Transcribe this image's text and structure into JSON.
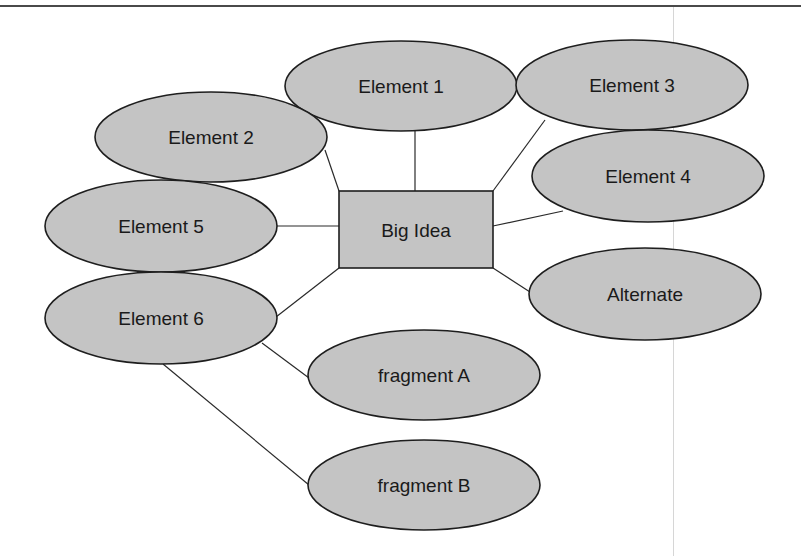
{
  "colors": {
    "node_fill": "#c4c4c4",
    "node_stroke": "#1e1e1e",
    "connector": "#2a2a2a",
    "text": "#1a1a1a",
    "background": "#ffffff"
  },
  "diagram": {
    "type": "concept-map",
    "center": {
      "id": "big-idea",
      "label": "Big Idea",
      "shape": "rectangle",
      "x": 339,
      "y": 191,
      "w": 154,
      "h": 77
    },
    "nodes": [
      {
        "id": "element-1",
        "label": "Element 1",
        "shape": "ellipse",
        "cx": 401,
        "cy": 86,
        "rx": 116,
        "ry": 45
      },
      {
        "id": "element-2",
        "label": "Element 2",
        "shape": "ellipse",
        "cx": 211,
        "cy": 137,
        "rx": 116,
        "ry": 45
      },
      {
        "id": "element-3",
        "label": "Element 3",
        "shape": "ellipse",
        "cx": 632,
        "cy": 85,
        "rx": 116,
        "ry": 45
      },
      {
        "id": "element-4",
        "label": "Element 4",
        "shape": "ellipse",
        "cx": 648,
        "cy": 176,
        "rx": 116,
        "ry": 46
      },
      {
        "id": "element-5",
        "label": "Element 5",
        "shape": "ellipse",
        "cx": 161,
        "cy": 226,
        "rx": 116,
        "ry": 46
      },
      {
        "id": "element-6",
        "label": "Element 6",
        "shape": "ellipse",
        "cx": 161,
        "cy": 318,
        "rx": 116,
        "ry": 46
      },
      {
        "id": "alternate",
        "label": "Alternate",
        "shape": "ellipse",
        "cx": 645,
        "cy": 294,
        "rx": 116,
        "ry": 46
      },
      {
        "id": "fragment-a",
        "label": "fragment A",
        "shape": "ellipse",
        "cx": 424,
        "cy": 375,
        "rx": 116,
        "ry": 45
      },
      {
        "id": "fragment-b",
        "label": "fragment B",
        "shape": "ellipse",
        "cx": 424,
        "cy": 485,
        "rx": 116,
        "ry": 45
      }
    ],
    "edges": [
      {
        "from": "element-2",
        "to": "big-idea",
        "x1": 325,
        "y1": 150,
        "x2": 339,
        "y2": 191
      },
      {
        "from": "element-1",
        "to": "big-idea",
        "x1": 415,
        "y1": 131,
        "x2": 415,
        "y2": 191
      },
      {
        "from": "element-3",
        "to": "big-idea",
        "x1": 545,
        "y1": 120,
        "x2": 493,
        "y2": 191
      },
      {
        "from": "element-4",
        "to": "big-idea",
        "x1": 563,
        "y1": 211,
        "x2": 493,
        "y2": 226
      },
      {
        "from": "element-5",
        "to": "big-idea",
        "x1": 277,
        "y1": 226,
        "x2": 339,
        "y2": 226
      },
      {
        "from": "element-6",
        "to": "big-idea",
        "x1": 276,
        "y1": 317,
        "x2": 339,
        "y2": 268
      },
      {
        "from": "big-idea",
        "to": "alternate",
        "x1": 493,
        "y1": 268,
        "x2": 530,
        "y2": 292
      },
      {
        "from": "element-6",
        "to": "fragment-a",
        "x1": 262,
        "y1": 343,
        "x2": 309,
        "y2": 378
      },
      {
        "from": "element-6",
        "to": "fragment-b",
        "x1": 163,
        "y1": 364,
        "x2": 309,
        "y2": 485
      }
    ]
  }
}
